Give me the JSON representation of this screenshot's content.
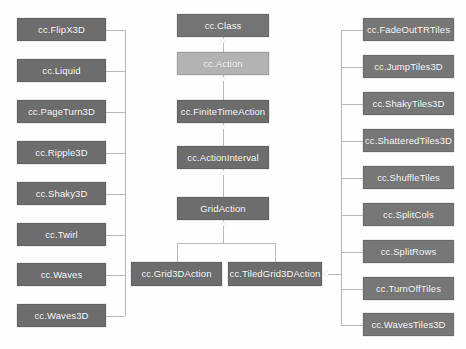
{
  "diagram": {
    "type": "uml-class-hierarchy",
    "background_color": "#fefefe",
    "edge_color": "#b9b9b9",
    "node_colors": {
      "dark": "#6d6d6d",
      "mid": "#747474",
      "light": "#b3b3b3",
      "right": "#777777"
    }
  },
  "spine": [
    {
      "label": "cc.Class",
      "x": 177,
      "y": 14,
      "w": 92,
      "h": 23,
      "shade": "mid"
    },
    {
      "label": "cc.Action",
      "x": 177,
      "y": 52,
      "w": 92,
      "h": 23,
      "shade": "light"
    },
    {
      "label": "cc.FiniteTimeAction",
      "x": 177,
      "y": 100,
      "w": 92,
      "h": 23,
      "shade": "dark"
    },
    {
      "label": "cc.ActionInterval",
      "x": 177,
      "y": 146,
      "w": 92,
      "h": 23,
      "shade": "dark"
    },
    {
      "label": "GridAction",
      "x": 177,
      "y": 197,
      "w": 92,
      "h": 23,
      "shade": "dark"
    }
  ],
  "grid_subclasses": [
    {
      "label": "cc.Grid3DAction",
      "x": 131,
      "y": 262,
      "w": 91,
      "h": 24,
      "shade": "dark"
    },
    {
      "label": "cc.TiledGrid3DAction",
      "x": 228,
      "y": 262,
      "w": 94,
      "h": 24,
      "shade": "dark"
    }
  ],
  "grid3d_children": [
    {
      "label": "cc.FlipX3D",
      "x": 17,
      "y": 18,
      "w": 89,
      "h": 23
    },
    {
      "label": "cc.Liquid",
      "x": 17,
      "y": 59,
      "w": 89,
      "h": 23
    },
    {
      "label": "cc.PageTurn3D",
      "x": 17,
      "y": 100,
      "w": 89,
      "h": 23
    },
    {
      "label": "cc.Ripple3D",
      "x": 17,
      "y": 141,
      "w": 89,
      "h": 23
    },
    {
      "label": "cc.Shaky3D",
      "x": 17,
      "y": 182,
      "w": 89,
      "h": 23
    },
    {
      "label": "cc.Twirl",
      "x": 17,
      "y": 223,
      "w": 89,
      "h": 23
    },
    {
      "label": "cc.Waves",
      "x": 17,
      "y": 263,
      "w": 89,
      "h": 23
    },
    {
      "label": "cc.Waves3D",
      "x": 17,
      "y": 304,
      "w": 89,
      "h": 23
    }
  ],
  "tiledgrid3d_children": [
    {
      "label": "cc.FadeOutTRTiles",
      "x": 363,
      "y": 18,
      "w": 91,
      "h": 23
    },
    {
      "label": "cc.JumpTiles3D",
      "x": 363,
      "y": 55,
      "w": 91,
      "h": 23
    },
    {
      "label": "cc.ShakyTiles3D",
      "x": 363,
      "y": 92,
      "w": 91,
      "h": 23
    },
    {
      "label": "cc.ShatteredTiles3D",
      "x": 363,
      "y": 129,
      "w": 91,
      "h": 23
    },
    {
      "label": "cc.ShuffleTiles",
      "x": 363,
      "y": 166,
      "w": 91,
      "h": 23
    },
    {
      "label": "cc.SplitCols",
      "x": 363,
      "y": 203,
      "w": 91,
      "h": 23
    },
    {
      "label": "cc.SplitRows",
      "x": 363,
      "y": 240,
      "w": 91,
      "h": 23
    },
    {
      "label": "cc.TurnOffTiles",
      "x": 363,
      "y": 277,
      "w": 91,
      "h": 23
    },
    {
      "label": "cc.WavesTiles3D",
      "x": 363,
      "y": 313,
      "w": 91,
      "h": 23
    }
  ]
}
